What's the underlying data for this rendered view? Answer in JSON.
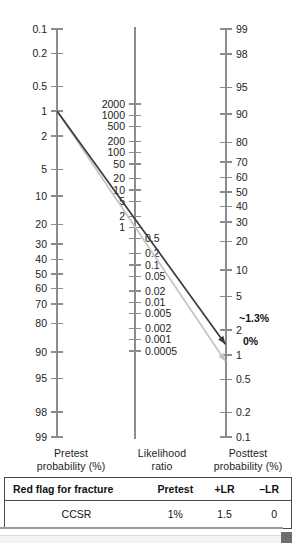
{
  "chart_data": {
    "type": "line",
    "axes": [
      {
        "name": "pretest",
        "label": "Pretest\nprobability (%)",
        "ticks": [
          "0.1",
          "0.2",
          "0.5",
          "1",
          "2",
          "5",
          "10",
          "20",
          "30",
          "40",
          "50",
          "60",
          "70",
          "80",
          "90",
          "95",
          "98",
          "99"
        ],
        "orientation": "descending-to-ascending",
        "units": "%"
      },
      {
        "name": "likelihood_ratio",
        "label": "Likelihood\nratio",
        "ticks_upper": [
          "2000",
          "1000",
          "500",
          "200",
          "100",
          "50",
          "20",
          "10",
          "5",
          "2",
          "1"
        ],
        "ticks_lower": [
          "0.5",
          "0.2",
          "0.1",
          "0.05",
          "0.02",
          "0.01",
          "0.005",
          "0.002",
          "0.001",
          "0.0005"
        ],
        "units": "ratio"
      },
      {
        "name": "posttest",
        "label": "Posttest\nprobability (%)",
        "ticks": [
          "99",
          "98",
          "95",
          "90",
          "80",
          "70",
          "60",
          "50",
          "40",
          "30",
          "20",
          "10",
          "5",
          "2",
          "1",
          "0.5",
          "0.2",
          "0.1"
        ],
        "units": "%"
      }
    ],
    "series": [
      {
        "name": "positive-likelihood-ratio-line",
        "color": "#3b3b3b",
        "pretest": 1,
        "likelihood_ratio": 1.5,
        "posttest": 1.3,
        "annotation": "~1.3%"
      },
      {
        "name": "negative-likelihood-ratio-line",
        "color": "#c3c3c3",
        "pretest": 1,
        "likelihood_ratio": 0,
        "posttest": 0,
        "annotation": "0%"
      }
    ],
    "annotations": [
      {
        "text": "~1.3%",
        "series": "positive-likelihood-ratio-line"
      },
      {
        "text": "0%",
        "series": "negative-likelihood-ratio-line"
      }
    ],
    "grid": false,
    "legend": "none"
  },
  "axis_titles": {
    "pretest_line1": "Pretest",
    "pretest_line2": "probability (%)",
    "lr_line1": "Likelihood",
    "lr_line2": "ratio",
    "posttest_line1": "Posttest",
    "posttest_line2": "probability (%)"
  },
  "annotations": {
    "positive": "~1.3%",
    "negative": "0%"
  },
  "table": {
    "headers": [
      "Red flag for fracture",
      "Pretest",
      "+LR",
      "–LR"
    ],
    "rows": [
      [
        "CCSR",
        "1%",
        "1.5",
        "0"
      ]
    ]
  },
  "colors": {
    "axis": "#8c8c8c",
    "tick_text": "#1d1d1d",
    "positive_line": "#3b3b3b",
    "negative_line": "#c4c4c4",
    "table_border": "#4a4a4a",
    "scroll_thumb": "#6d6d6d"
  }
}
